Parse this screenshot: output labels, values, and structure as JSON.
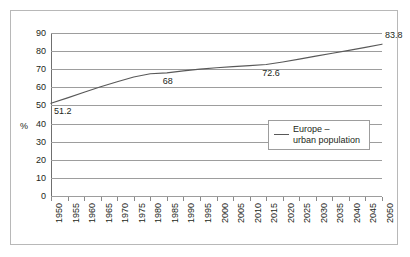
{
  "chart_data": {
    "type": "line",
    "title": "",
    "xlabel": "",
    "ylabel": "%",
    "ylim": [
      0,
      90
    ],
    "ytick_step": 10,
    "yticks": [
      90,
      80,
      70,
      60,
      50,
      40,
      30,
      20,
      10,
      0
    ],
    "grid": true,
    "legend_position": "inside-right",
    "categories": [
      "1950",
      "1955",
      "1960",
      "1965",
      "1970",
      "1975",
      "1980",
      "1985",
      "1990",
      "1995",
      "2000",
      "2005",
      "2010",
      "2015",
      "2020",
      "2025",
      "2030",
      "2035",
      "2040",
      "2045",
      "2050"
    ],
    "series": [
      {
        "name": "Europe – urban population",
        "color": "#595959",
        "values": [
          51.2,
          54.2,
          57.3,
          60.3,
          63.1,
          65.7,
          67.5,
          68.0,
          69.1,
          70.0,
          70.8,
          71.4,
          72.0,
          72.6,
          74.0,
          75.6,
          77.2,
          78.8,
          80.4,
          82.1,
          83.8
        ]
      }
    ],
    "point_labels": [
      {
        "text": "51.2",
        "x_category": "1950",
        "value": 51.2
      },
      {
        "text": "68",
        "x_category": "1985",
        "value": 68.0
      },
      {
        "text": "72.6",
        "x_category": "2015",
        "value": 72.6
      },
      {
        "text": "83.8",
        "x_category": "2050",
        "value": 83.8
      }
    ],
    "legend": [
      {
        "line1": "Europe –",
        "line2": "urban population"
      }
    ]
  },
  "axis": {
    "y_title": "%"
  },
  "legend": {
    "entry_line1": "Europe –",
    "entry_line2": "urban population"
  },
  "colors": {
    "series": "#595959",
    "gridline": "#9d9d9d",
    "frame": "#b8b8b8",
    "text": "#231f20",
    "background": "#ffffff"
  }
}
